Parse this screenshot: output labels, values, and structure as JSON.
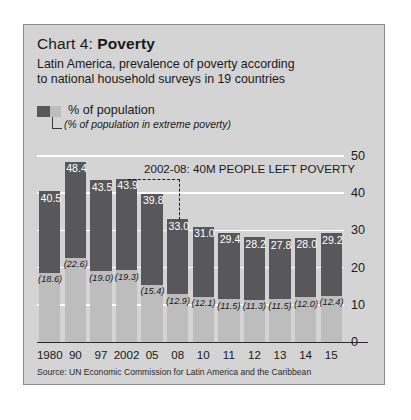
{
  "panel": {
    "title_prefix": "Chart 4: ",
    "title_main": "Poverty",
    "subtitle_line1": "Latin America, prevalence of poverty according",
    "subtitle_line2": "to national household surveys in 19 countries",
    "source": "Source: UN Economic Commission for Latin America and the Caribbean"
  },
  "legend": {
    "primary_label": "% of population",
    "secondary_label": "(% of population in extreme poverty)",
    "primary_color": "#58585a",
    "secondary_color": "#bdbdbd"
  },
  "annotation": {
    "text": "2002-08: 40M PEOPLE LEFT POVERTY"
  },
  "yticks": [
    "50",
    "40",
    "30",
    "20",
    "10",
    "0"
  ],
  "chart_data": {
    "type": "bar",
    "title": "Chart 4: Poverty",
    "subtitle": "Latin America, prevalence of poverty according to national household surveys in 19 countries",
    "xlabel": "",
    "ylabel": "",
    "ylim": [
      0,
      50
    ],
    "yticks": [
      0,
      10,
      20,
      30,
      40,
      50
    ],
    "grid": true,
    "legend_position": "above-plot",
    "categories": [
      "1980",
      "90",
      "97",
      "2002",
      "05",
      "08",
      "10",
      "11",
      "12",
      "13",
      "14",
      "15"
    ],
    "series": [
      {
        "name": "% of population",
        "color": "#58585a",
        "values": [
          40.5,
          48.4,
          43.5,
          43.9,
          39.8,
          33.0,
          31.0,
          29.4,
          28.2,
          27.8,
          28.0,
          29.2
        ],
        "labels": [
          "40.5",
          "48.4",
          "43.5",
          "43.9",
          "39.8",
          "33.0",
          "31.0",
          "29.4",
          "28.2",
          "27.8",
          "28.0",
          "29.2"
        ]
      },
      {
        "name": "(% of population in extreme poverty)",
        "color": "#bdbdbd",
        "values": [
          18.6,
          22.6,
          19.0,
          19.3,
          15.4,
          12.9,
          12.1,
          11.5,
          11.3,
          11.5,
          12.0,
          12.4
        ],
        "labels": [
          "(18.6)",
          "(22.6)",
          "(19.0)",
          "(19.3)",
          "(15.4)",
          "(12.9)",
          "(12.1)",
          "(11.5)",
          "(11.3)",
          "(11.5)",
          "(12.0)",
          "(12.4)"
        ]
      }
    ],
    "annotations": [
      {
        "text": "2002-08: 40M PEOPLE LEFT POVERTY",
        "from": "2002",
        "to": "08",
        "from_value": 43.9,
        "to_value": 33.0
      }
    ],
    "source": "Source: UN Economic Commission for Latin America and the Caribbean"
  }
}
